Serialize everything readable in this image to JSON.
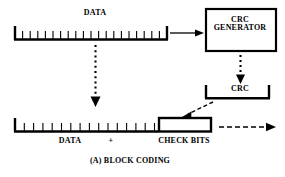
{
  "figure": {
    "caption": "(A)  BLOCK CODING",
    "background_color": "#ffffff",
    "ink_color": "#000000"
  },
  "labels": {
    "data_top": "DATA",
    "crc_generator": "CRC\nGENERATOR",
    "crc_generator_line1": "CRC",
    "crc_generator_line2": "GENERATOR",
    "crc": "CRC",
    "data_bottom": "DATA",
    "plus": "+",
    "check_bits": "CHECK BITS"
  },
  "diagram": {
    "type": "block-coding-schematic",
    "top_data_frame": {
      "name": "DATA",
      "tick_count": 19,
      "style": "bracket-with-ticks"
    },
    "crc_generator_block": {
      "name": "CRC GENERATOR",
      "style": "rectangle-outline"
    },
    "crc_block": {
      "name": "CRC",
      "style": "u-bracket"
    },
    "bottom_codeword": {
      "data_part": {
        "name": "DATA",
        "tick_count": 15,
        "style": "bracket-with-ticks"
      },
      "check_part": {
        "name": "CHECK BITS",
        "style": "hollow-rectangle"
      }
    },
    "arrows": [
      {
        "name": "data-to-crc-generator",
        "style": "solid",
        "direction": "right"
      },
      {
        "name": "crc-generator-to-crc",
        "style": "dotted",
        "direction": "down"
      },
      {
        "name": "data-to-codeword",
        "style": "dotted",
        "direction": "down"
      },
      {
        "name": "crc-to-check-bits",
        "style": "dashed",
        "direction": "down-left"
      },
      {
        "name": "codeword-output",
        "style": "dash-dot",
        "direction": "right"
      }
    ]
  }
}
